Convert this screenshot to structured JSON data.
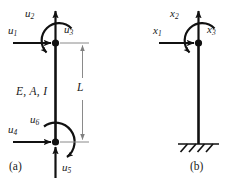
{
  "figure": {
    "type": "structural-engineering-diagram",
    "ink_color": "#111111",
    "dimension_color": "#808080",
    "panels": [
      {
        "id": "a",
        "caption": "(a)",
        "member_label": "E, A, I",
        "length_label": "L",
        "dof_labels": [
          {
            "name": "u1",
            "text": "u",
            "sub": "1",
            "kind": "translation-horizontal"
          },
          {
            "name": "u2",
            "text": "u",
            "sub": "2",
            "kind": "translation-vertical"
          },
          {
            "name": "u3",
            "text": "u",
            "sub": "3",
            "kind": "rotation"
          },
          {
            "name": "u4",
            "text": "u",
            "sub": "4",
            "kind": "translation-horizontal"
          },
          {
            "name": "u5",
            "text": "u",
            "sub": "5",
            "kind": "translation-vertical"
          },
          {
            "name": "u6",
            "text": "u",
            "sub": "6",
            "kind": "rotation"
          }
        ]
      },
      {
        "id": "b",
        "caption": "(b)",
        "support": "fixed-base",
        "dof_labels": [
          {
            "name": "x1",
            "text": "x",
            "sub": "1",
            "kind": "translation-horizontal"
          },
          {
            "name": "x2",
            "text": "x",
            "sub": "2",
            "kind": "translation-vertical"
          },
          {
            "name": "x3",
            "text": "x",
            "sub": "3",
            "kind": "rotation"
          }
        ]
      }
    ]
  }
}
